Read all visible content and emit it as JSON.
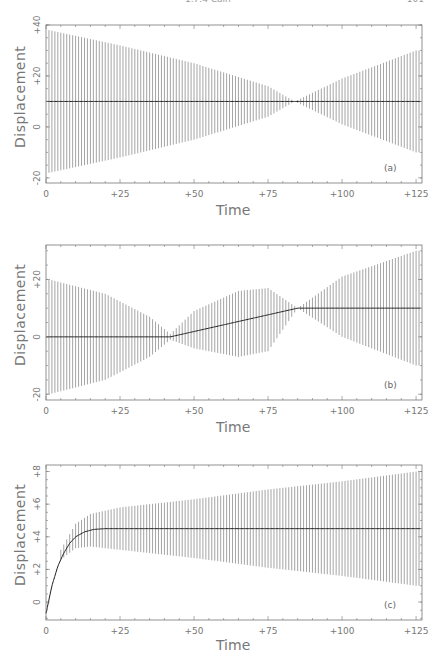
{
  "header": {
    "center_text": "1.7.4 Cain",
    "page_number": "101"
  },
  "chart_data": [
    {
      "type": "line",
      "panel_label": "(a)",
      "title": "",
      "xlabel": "Time",
      "ylabel": "Displacement",
      "xlim": [
        0,
        127
      ],
      "ylim": [
        -22,
        40
      ],
      "xticks": [
        0,
        25,
        50,
        75,
        100,
        125
      ],
      "xtick_labels": [
        "0",
        "+25",
        "+50",
        "+75",
        "+100",
        "+125"
      ],
      "yticks": [
        -20,
        0,
        20,
        40
      ],
      "ytick_labels": [
        "-20",
        "0",
        "+20",
        "+40"
      ],
      "grid": false,
      "description": "Dense vertical oscillation bars around a constant mean; envelope shrinks to zero near t=84 then grows",
      "series": [
        {
          "name": "mean",
          "x": [
            0,
            127
          ],
          "y": [
            10,
            10
          ]
        },
        {
          "name": "envelope_upper",
          "x": [
            1,
            25,
            50,
            75,
            84,
            100,
            125
          ],
          "y": [
            38,
            32,
            25,
            16,
            10,
            19,
            30
          ]
        },
        {
          "name": "envelope_lower",
          "x": [
            1,
            25,
            50,
            75,
            84,
            100,
            125
          ],
          "y": [
            -18,
            -12,
            -5,
            4,
            10,
            1,
            -10
          ]
        }
      ]
    },
    {
      "type": "line",
      "panel_label": "(b)",
      "title": "",
      "xlabel": "Time",
      "ylabel": "Displacement",
      "xlim": [
        0,
        127
      ],
      "ylim": [
        -22,
        32
      ],
      "xticks": [
        0,
        25,
        50,
        75,
        100,
        125
      ],
      "xtick_labels": [
        "0",
        "+25",
        "+50",
        "+75",
        "+100",
        "+125"
      ],
      "yticks": [
        -20,
        0,
        20
      ],
      "ytick_labels": [
        "-20",
        "0",
        "+20"
      ],
      "grid": false,
      "description": "Oscillation envelope collapses at t~42 and t~85; mean ramps linearly from 0 to 10 between them",
      "series": [
        {
          "name": "mean",
          "x": [
            0,
            42,
            85,
            127
          ],
          "y": [
            0,
            0,
            10,
            10
          ]
        },
        {
          "name": "envelope_upper",
          "x": [
            1,
            20,
            35,
            42,
            50,
            65,
            75,
            85,
            100,
            125
          ],
          "y": [
            20,
            15,
            7,
            1,
            9,
            16,
            17,
            10,
            21,
            30
          ]
        },
        {
          "name": "envelope_lower",
          "x": [
            1,
            20,
            35,
            42,
            50,
            65,
            75,
            85,
            100,
            125
          ],
          "y": [
            -20,
            -15,
            -7,
            -1,
            -4,
            -7,
            -5,
            10,
            0,
            -10
          ]
        }
      ]
    },
    {
      "type": "line",
      "panel_label": "(c)",
      "title": "",
      "xlabel": "Time",
      "ylabel": "Displacement",
      "xlim": [
        0,
        127
      ],
      "ylim": [
        -1.1,
        8.4
      ],
      "xticks": [
        0,
        25,
        50,
        75,
        100,
        125
      ],
      "xtick_labels": [
        "0",
        "+25",
        "+50",
        "+75",
        "+100",
        "+125"
      ],
      "yticks": [
        0,
        2,
        4,
        6,
        8
      ],
      "ytick_labels": [
        "0",
        "+2",
        "+4",
        "+6",
        "+8"
      ],
      "grid": false,
      "description": "Mean rises quickly from about -0.7 and saturates near 4.5; oscillation envelope widens slowly over time",
      "series": [
        {
          "name": "mean",
          "x": [
            0,
            2,
            4,
            6,
            8,
            10,
            13,
            16,
            20,
            30,
            127
          ],
          "y": [
            -0.7,
            1.0,
            2.2,
            3.0,
            3.6,
            4.0,
            4.3,
            4.45,
            4.5,
            4.5,
            4.5
          ]
        },
        {
          "name": "envelope_upper",
          "x": [
            5,
            10,
            15,
            25,
            50,
            75,
            100,
            125
          ],
          "y": [
            3.2,
            4.8,
            5.4,
            5.8,
            6.3,
            6.9,
            7.4,
            8.0
          ]
        },
        {
          "name": "envelope_lower",
          "x": [
            5,
            10,
            15,
            25,
            50,
            75,
            100,
            125
          ],
          "y": [
            2.6,
            3.3,
            3.4,
            3.2,
            2.7,
            2.1,
            1.6,
            1.0
          ]
        }
      ]
    }
  ]
}
